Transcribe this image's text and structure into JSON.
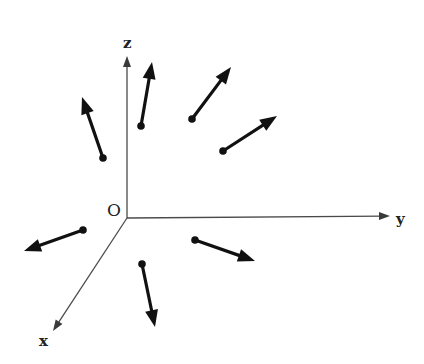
{
  "diagram": {
    "title": "",
    "colors": {
      "background": "#ffffff",
      "axis": "#4a4a4a",
      "vector": "#111111",
      "text": "#222222"
    },
    "origin": {
      "label": "O",
      "point": [
        127,
        218
      ],
      "label_pos": [
        107,
        202
      ]
    },
    "axes": [
      {
        "name": "z",
        "label": "z",
        "from": [
          127,
          218
        ],
        "to": [
          127,
          56
        ],
        "label_pos": [
          123,
          36
        ]
      },
      {
        "name": "y",
        "label": "y",
        "from": [
          127,
          218
        ],
        "to": [
          390,
          216
        ],
        "label_pos": [
          396,
          212
        ]
      },
      {
        "name": "x",
        "label": "x",
        "from": [
          127,
          218
        ],
        "to": [
          53,
          331
        ],
        "label_pos": [
          39,
          334
        ]
      }
    ],
    "vectors": [
      {
        "id": "v1",
        "tail": [
          141,
          126
        ],
        "head": [
          152,
          62
        ]
      },
      {
        "id": "v2",
        "tail": [
          103,
          158
        ],
        "head": [
          82,
          97
        ]
      },
      {
        "id": "v3",
        "tail": [
          192,
          119
        ],
        "head": [
          231,
          67
        ]
      },
      {
        "id": "v4",
        "tail": [
          223,
          151
        ],
        "head": [
          277,
          116
        ]
      },
      {
        "id": "v5",
        "tail": [
          83,
          230
        ],
        "head": [
          24,
          251
        ]
      },
      {
        "id": "v6",
        "tail": [
          195,
          240
        ],
        "head": [
          255,
          261
        ]
      },
      {
        "id": "v7",
        "tail": [
          142,
          264
        ],
        "head": [
          155,
          327
        ]
      }
    ]
  }
}
